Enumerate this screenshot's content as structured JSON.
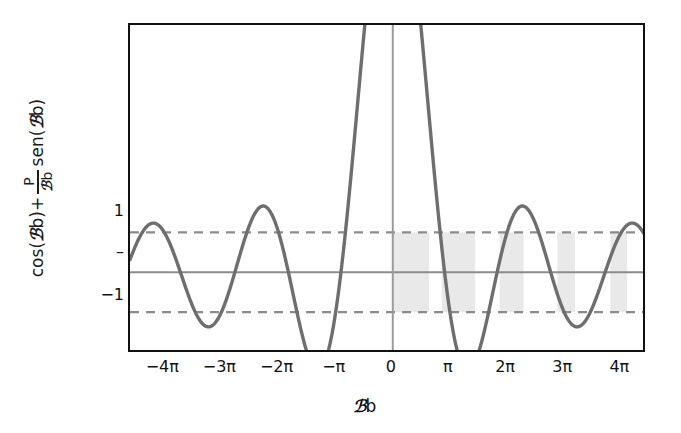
{
  "chart_data": {
    "type": "line",
    "title": "",
    "xlabel": "ℬb",
    "ylabel": "cos(ℬb)+ P/ℬb sen(ℬb)",
    "ylabel_parts": {
      "prefix": "cos(",
      "k1": "ℬ",
      "mid": "b)+",
      "frac_num": "P",
      "frac_k": "ℬ",
      "frac_den_b": "b",
      "suffix": "sen(",
      "k2": "ℬ",
      "tail": "b)"
    },
    "xtick_labels": [
      "−4π",
      "−3π",
      "−2π",
      "−π",
      "0",
      "π",
      "2π",
      "3π",
      "4π"
    ],
    "xtick_values": [
      -4,
      -3,
      -2,
      -1,
      0,
      1,
      2,
      3,
      4
    ],
    "ytick_labels": [
      "1",
      "–",
      "−1"
    ],
    "ytick_values": [
      1,
      0,
      -1
    ],
    "xlim": [
      -4.6,
      4.45
    ],
    "ylim": [
      -2.05,
      6.2
    ],
    "grid": false,
    "legend": null,
    "function": "cos(x)+P*sin(x)/x",
    "parameter_P": 9.5,
    "reference_lines": [
      {
        "value": 1,
        "style": "dashed",
        "color": "#8c8c8c"
      },
      {
        "value": 0,
        "style": "solid",
        "color": "#8c8c8c"
      },
      {
        "value": -1,
        "style": "dashed",
        "color": "#8c8c8c"
      }
    ],
    "vertical_axis_line": {
      "value": 0,
      "style": "solid",
      "color": "#9a9a9a"
    },
    "curve_color": "#6e6e6e",
    "band_fill_color": "#e9e9e9",
    "allowed_bands": [
      {
        "x_start": 0.0,
        "x_end": 0.635
      },
      {
        "x_start": 0.855,
        "x_end": 1.44
      },
      {
        "x_start": 1.87,
        "x_end": 2.29
      },
      {
        "x_start": 2.88,
        "x_end": 3.19
      },
      {
        "x_start": 3.81,
        "x_end": 4.1
      }
    ]
  }
}
